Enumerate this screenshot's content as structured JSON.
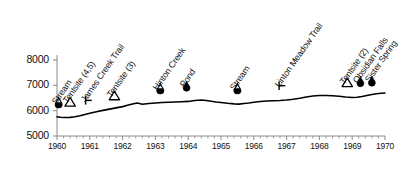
{
  "chart_data": {
    "type": "line",
    "title": "",
    "xlabel": "",
    "ylabel": "",
    "xlim": [
      1960,
      1970
    ],
    "ylim": [
      5000,
      8000
    ],
    "grid": false,
    "legend_position": "none",
    "x_ticks": [
      1960,
      1961,
      1962,
      1963,
      1964,
      1965,
      1966,
      1967,
      1968,
      1969,
      1970
    ],
    "y_ticks": [
      5000,
      6000,
      7000,
      8000
    ],
    "x_minor_ticks_per_interval": 5,
    "series": [
      {
        "name": "Elevation Profile",
        "x": [
          1960.0,
          1960.1,
          1960.25,
          1960.4,
          1960.55,
          1960.7,
          1960.85,
          1961.0,
          1961.2,
          1961.4,
          1961.6,
          1961.8,
          1962.0,
          1962.15,
          1962.3,
          1962.45,
          1962.6,
          1962.8,
          1963.0,
          1963.2,
          1963.4,
          1963.6,
          1963.8,
          1964.0,
          1964.2,
          1964.4,
          1964.55,
          1964.7,
          1964.85,
          1965.0,
          1965.2,
          1965.4,
          1965.55,
          1965.7,
          1965.85,
          1966.0,
          1966.2,
          1966.4,
          1966.6,
          1966.8,
          1967.0,
          1967.2,
          1967.4,
          1967.6,
          1967.8,
          1968.0,
          1968.2,
          1968.4,
          1968.6,
          1968.8,
          1969.0,
          1969.15,
          1969.3,
          1969.45,
          1969.6,
          1969.8,
          1970.0
        ],
        "y": [
          5760,
          5740,
          5730,
          5735,
          5760,
          5800,
          5850,
          5900,
          5960,
          6010,
          6060,
          6110,
          6160,
          6210,
          6260,
          6300,
          6250,
          6285,
          6300,
          6320,
          6330,
          6340,
          6350,
          6365,
          6400,
          6420,
          6400,
          6370,
          6340,
          6320,
          6290,
          6270,
          6260,
          6280,
          6300,
          6330,
          6360,
          6380,
          6390,
          6400,
          6420,
          6450,
          6490,
          6540,
          6580,
          6600,
          6600,
          6590,
          6570,
          6540,
          6520,
          6530,
          6560,
          6600,
          6640,
          6680,
          6700
        ]
      }
    ],
    "waypoints": [
      {
        "label": "Stream",
        "x": 1960.05,
        "marker": "half-droplet",
        "marker_y": 6150
      },
      {
        "label": "Tentsite (4,5)",
        "x": 1960.4,
        "marker": "open-triangle",
        "marker_y": 6180
      },
      {
        "label": "James Creek Trail",
        "x": 1960.95,
        "marker": "trail-junction",
        "marker_y": 6240
      },
      {
        "label": "Tentsite (3)",
        "x": 1961.75,
        "marker": "open-triangle",
        "marker_y": 6430
      },
      {
        "label": "Hinton Creek",
        "x": 1963.15,
        "marker": "half-droplet",
        "marker_y": 6700
      },
      {
        "label": "Pond",
        "x": 1963.95,
        "marker": "full-droplet",
        "marker_y": 6800
      },
      {
        "label": "Stream",
        "x": 1965.5,
        "marker": "half-droplet",
        "marker_y": 6700
      },
      {
        "label": "Linton Meadow Trail",
        "x": 1966.85,
        "marker": "trail-junction",
        "marker_y": 6820
      },
      {
        "label": "Tentsite (2)",
        "x": 1968.85,
        "marker": "open-triangle",
        "marker_y": 6950
      },
      {
        "label": "Obsidian Falls",
        "x": 1969.25,
        "marker": "full-droplet",
        "marker_y": 6980
      },
      {
        "label": "Sister Spring",
        "x": 1969.6,
        "marker": "full-droplet",
        "marker_y": 7000
      }
    ],
    "colors": {
      "line": "#000000",
      "axis": "#8a8a8a",
      "text": "#111111",
      "marker_fill": "#000000",
      "marker_open": "#ffffff",
      "background": "#ffffff"
    }
  }
}
